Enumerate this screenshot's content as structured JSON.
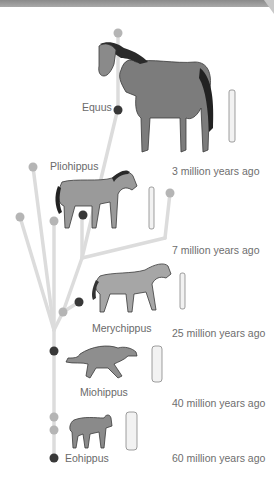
{
  "diagram": {
    "species": [
      {
        "name": "Equus",
        "time": "3 million years ago"
      },
      {
        "name": "Pliohippus",
        "time": "7 million years ago"
      },
      {
        "name": "Merychippus",
        "time": "25 million years ago"
      },
      {
        "name": "Miohippus",
        "time": "40 million years ago"
      },
      {
        "name": "Eohippus",
        "time": "60 million years ago"
      }
    ],
    "times": [
      "3 million years ago",
      "7 million years ago",
      "25 million years ago",
      "40 million years ago",
      "60 million years ago"
    ],
    "colors": {
      "branch": "#dadada",
      "extinct_node": "#b5b5b5",
      "lineage_node": "#3a3a3a",
      "text": "#6a6a6a"
    }
  }
}
